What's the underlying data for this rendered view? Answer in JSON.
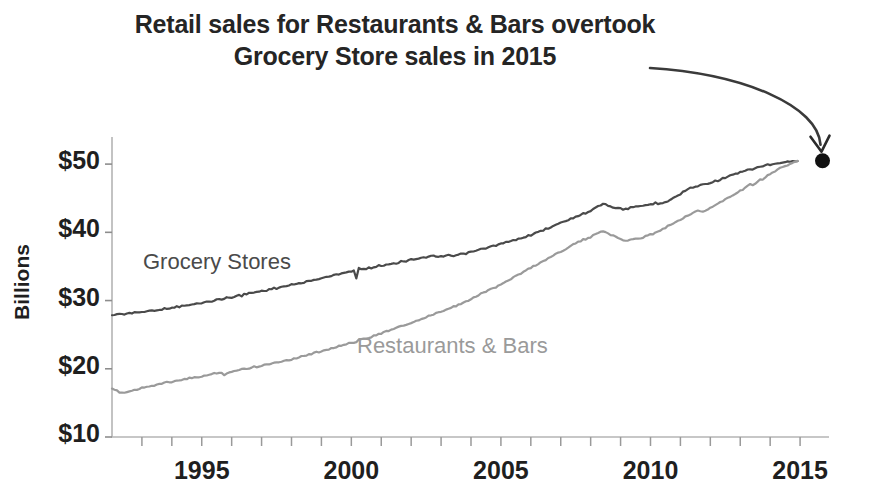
{
  "chart_data": {
    "type": "line",
    "title": "Retail sales for Restaurants & Bars overtook\nGrocery Store sales in 2015",
    "xlabel": "",
    "ylabel": "Billions",
    "xlim": [
      1992,
      2015.9
    ],
    "ylim": [
      10,
      53
    ],
    "grid": false,
    "legend_position": "inline-labels",
    "y_tick_labels": [
      "$10",
      "$20",
      "$30",
      "$40",
      "$50"
    ],
    "y_tick_values": [
      10,
      20,
      30,
      40,
      50
    ],
    "x_tick_labels": [
      "1995",
      "2000",
      "2005",
      "2010",
      "2015"
    ],
    "x_tick_values": [
      1995,
      2000,
      2005,
      2010,
      2015
    ],
    "x_minor_tick_interval": 1,
    "annotation": {
      "text": "arrow from title to 2015 convergence point",
      "marker_x": 2015.75,
      "marker_y": 50.5,
      "marker_color": "#111111"
    },
    "series": [
      {
        "name": "Grocery Stores",
        "color": "#4a4a4a",
        "label_x": 1994.2,
        "label_y": 34.2,
        "x_start": 1992.0,
        "x_step": 0.08333,
        "values": [
          27.9,
          27.9,
          28.0,
          28.0,
          28.1,
          28.0,
          28.1,
          28.2,
          28.1,
          28.2,
          28.3,
          28.3,
          28.3,
          28.4,
          28.4,
          28.5,
          28.5,
          28.6,
          28.6,
          28.7,
          28.7,
          28.8,
          28.8,
          28.9,
          28.9,
          29.0,
          29.1,
          29.1,
          29.2,
          29.2,
          29.3,
          29.3,
          29.4,
          29.5,
          29.5,
          29.6,
          29.7,
          29.7,
          29.8,
          29.9,
          29.9,
          30.0,
          30.1,
          30.2,
          30.2,
          30.3,
          30.4,
          30.4,
          30.5,
          30.6,
          30.7,
          30.8,
          30.6,
          30.9,
          31.0,
          31.1,
          31.1,
          31.2,
          31.3,
          31.3,
          31.4,
          31.5,
          31.5,
          31.6,
          31.7,
          31.8,
          31.8,
          31.9,
          32.0,
          32.1,
          32.1,
          32.2,
          32.3,
          32.4,
          32.4,
          32.5,
          32.6,
          32.7,
          32.8,
          32.8,
          32.9,
          33.0,
          33.1,
          33.2,
          33.3,
          33.4,
          33.4,
          33.5,
          33.6,
          33.7,
          33.8,
          33.9,
          34.0,
          34.1,
          34.2,
          34.2,
          34.3,
          34.4,
          33.2,
          34.8,
          34.5,
          34.6,
          34.7,
          34.8,
          34.8,
          34.9,
          35.0,
          35.1,
          35.1,
          35.2,
          35.3,
          35.3,
          35.4,
          35.5,
          35.5,
          35.6,
          35.7,
          35.8,
          35.8,
          35.9,
          36.0,
          36.1,
          36.1,
          36.2,
          36.3,
          36.4,
          36.3,
          36.4,
          36.5,
          36.5,
          36.4,
          36.5,
          36.5,
          36.4,
          36.5,
          36.6,
          36.6,
          36.5,
          36.6,
          36.7,
          36.8,
          36.8,
          36.9,
          37.0,
          37.1,
          37.2,
          37.3,
          37.4,
          37.5,
          37.6,
          37.7,
          37.8,
          37.9,
          38.0,
          38.1,
          38.2,
          38.3,
          38.4,
          38.5,
          38.6,
          38.7,
          38.8,
          38.9,
          39.0,
          39.1,
          39.3,
          39.4,
          39.5,
          39.6,
          39.8,
          39.9,
          40.0,
          40.2,
          40.3,
          40.5,
          40.6,
          40.8,
          40.9,
          41.1,
          41.2,
          41.4,
          41.5,
          41.7,
          41.8,
          42.0,
          42.1,
          42.3,
          42.4,
          42.6,
          42.7,
          42.8,
          43.0,
          43.2,
          43.5,
          43.7,
          43.9,
          44.0,
          44.2,
          44.1,
          43.9,
          43.8,
          43.7,
          43.6,
          43.5,
          43.5,
          43.4,
          43.5,
          43.5,
          43.6,
          43.6,
          43.7,
          43.7,
          43.8,
          43.9,
          44.0,
          44.0,
          44.1,
          44.2,
          44.3,
          44.2,
          44.3,
          44.4,
          44.5,
          44.6,
          44.8,
          45.0,
          45.2,
          45.4,
          45.6,
          45.9,
          46.1,
          46.3,
          46.5,
          46.6,
          46.7,
          46.8,
          46.9,
          47.0,
          47.1,
          47.2,
          47.3,
          47.4,
          47.5,
          47.6,
          47.7,
          47.9,
          48.0,
          48.1,
          48.3,
          48.4,
          48.5,
          48.6,
          48.8,
          48.9,
          49.0,
          49.1,
          49.2,
          49.3,
          49.4,
          49.5,
          49.6,
          49.7,
          49.8,
          49.9,
          49.9,
          50.0,
          50.0,
          50.1,
          50.1,
          50.2,
          50.2,
          50.3,
          50.3,
          50.4,
          50.4,
          50.5
        ]
      },
      {
        "name": "Restaurants & Bars",
        "color": "#9a9a9a",
        "label_x": 2004.6,
        "label_y": 24.2,
        "x_start": 1992.0,
        "x_step": 0.08333,
        "values": [
          17.0,
          16.9,
          16.8,
          16.6,
          16.5,
          16.5,
          16.6,
          16.7,
          16.8,
          16.9,
          17.0,
          17.1,
          17.2,
          17.3,
          17.4,
          17.5,
          17.5,
          17.6,
          17.7,
          17.8,
          17.8,
          17.9,
          18.0,
          18.0,
          18.1,
          18.2,
          18.2,
          18.3,
          18.4,
          18.4,
          18.5,
          18.6,
          18.6,
          18.7,
          18.8,
          18.8,
          18.9,
          19.0,
          19.0,
          19.1,
          19.2,
          19.3,
          19.3,
          19.4,
          19.5,
          19.0,
          19.4,
          19.5,
          19.6,
          19.7,
          19.7,
          19.8,
          19.9,
          20.0,
          20.0,
          20.1,
          20.2,
          20.3,
          20.3,
          20.4,
          20.5,
          20.6,
          20.6,
          20.7,
          20.8,
          20.9,
          20.9,
          21.0,
          21.1,
          21.2,
          21.3,
          21.3,
          21.4,
          21.5,
          21.6,
          21.7,
          21.8,
          21.9,
          22.0,
          22.1,
          22.2,
          22.3,
          22.4,
          22.5,
          22.6,
          22.7,
          22.8,
          22.9,
          23.0,
          23.1,
          23.2,
          23.3,
          23.4,
          23.5,
          23.6,
          23.7,
          23.8,
          23.9,
          24.0,
          24.2,
          24.3,
          24.4,
          24.5,
          24.6,
          24.7,
          24.9,
          25.0,
          25.1,
          25.2,
          25.3,
          25.5,
          25.6,
          25.7,
          25.8,
          26.0,
          26.1,
          26.2,
          26.3,
          26.5,
          26.6,
          26.7,
          26.9,
          27.0,
          27.1,
          27.3,
          27.4,
          27.5,
          27.7,
          27.8,
          27.9,
          28.1,
          28.2,
          28.3,
          28.5,
          28.6,
          28.8,
          28.9,
          29.1,
          29.2,
          29.4,
          29.5,
          29.7,
          29.8,
          30.0,
          30.2,
          30.4,
          30.6,
          30.8,
          31.0,
          31.2,
          31.3,
          31.5,
          31.7,
          31.9,
          32.0,
          32.2,
          32.4,
          32.6,
          32.8,
          33.0,
          33.2,
          33.4,
          33.6,
          33.8,
          34.0,
          34.2,
          34.4,
          34.6,
          34.8,
          35.0,
          35.2,
          35.4,
          35.6,
          35.8,
          36.0,
          36.2,
          36.4,
          36.6,
          36.8,
          37.0,
          37.2,
          37.4,
          37.6,
          37.8,
          38.0,
          38.2,
          38.4,
          38.6,
          38.7,
          38.9,
          39.0,
          39.1,
          39.3,
          39.5,
          39.7,
          39.9,
          40.1,
          40.2,
          40.1,
          39.9,
          39.7,
          39.5,
          39.3,
          39.1,
          39.0,
          38.9,
          38.8,
          38.8,
          38.9,
          38.9,
          39.0,
          39.1,
          39.2,
          39.3,
          39.4,
          39.5,
          39.7,
          39.8,
          40.0,
          40.1,
          40.3,
          40.5,
          40.7,
          40.9,
          41.1,
          41.3,
          41.5,
          41.7,
          41.9,
          42.1,
          42.3,
          42.5,
          42.7,
          42.9,
          43.0,
          43.1,
          43.1,
          43.0,
          43.2,
          43.4,
          43.6,
          43.8,
          44.0,
          44.2,
          44.4,
          44.6,
          44.8,
          45.0,
          45.2,
          45.4,
          45.6,
          45.9,
          46.1,
          46.3,
          46.5,
          46.8,
          47.0,
          46.8,
          47.2,
          47.5,
          47.7,
          47.6,
          48.0,
          48.3,
          48.5,
          48.8,
          49.0,
          49.2,
          49.4,
          49.6,
          49.8,
          49.9,
          50.1,
          50.2,
          50.4,
          50.5
        ]
      }
    ]
  },
  "plot_geometry": {
    "left": 112,
    "right": 827,
    "top": 145,
    "bottom": 437,
    "y_value_top": 52.8,
    "y_value_bottom": 10
  }
}
